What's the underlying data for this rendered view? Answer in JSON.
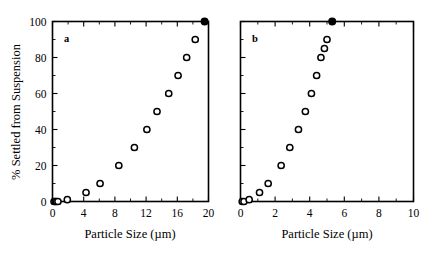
{
  "figure": {
    "background_color": "#ffffff",
    "foreground_color": "#000000",
    "shared_ylabel": "% Settled from Suspension",
    "panel_a_letter": "a",
    "panel_b_letter": "b"
  },
  "chart_data": [
    {
      "type": "scatter",
      "panel": "a",
      "title": "",
      "xlabel": "Particle Size (µm)",
      "ylabel": "% Settled from Suspension",
      "xlim": [
        0,
        20
      ],
      "ylim": [
        0,
        100
      ],
      "xticks": [
        0,
        4,
        8,
        12,
        16,
        20
      ],
      "xticklabels": [
        "0",
        "4",
        "8",
        "12",
        "16",
        "20"
      ],
      "xminor_step": 2,
      "yticks": [
        0,
        20,
        40,
        60,
        80,
        100
      ],
      "yticklabels": [
        "0",
        "20",
        "40",
        "60",
        "80",
        "100"
      ],
      "yminor_step": 10,
      "grid": false,
      "legend": false,
      "series": [
        {
          "name": "open-circles",
          "marker": "open-circle",
          "x": [
            0.2,
            0.35,
            0.5,
            0.7,
            1.9,
            4.3,
            6.1,
            8.5,
            10.5,
            12.1,
            13.4,
            14.9,
            16.1,
            17.2,
            18.3
          ],
          "y": [
            0,
            0,
            0,
            0,
            1,
            5,
            10,
            20,
            30,
            40,
            50,
            60,
            70,
            80,
            90
          ]
        },
        {
          "name": "filled-circle",
          "marker": "filled-circle",
          "x": [
            19.5
          ],
          "y": [
            100
          ]
        }
      ]
    },
    {
      "type": "scatter",
      "panel": "b",
      "title": "",
      "xlabel": "Particle Size (µm)",
      "ylabel": "% Settled from Suspension",
      "xlim": [
        0,
        10
      ],
      "ylim": [
        0,
        100
      ],
      "xticks": [
        0,
        2,
        4,
        6,
        8,
        10
      ],
      "xticklabels": [
        "0",
        "2",
        "4",
        "6",
        "8",
        "10"
      ],
      "xminor_step": 1,
      "yticks": [
        0,
        20,
        40,
        60,
        80,
        100
      ],
      "yticklabels": [
        "0",
        "20",
        "40",
        "60",
        "80",
        "100"
      ],
      "yminor_step": 10,
      "grid": false,
      "legend": false,
      "series": [
        {
          "name": "open-circles",
          "marker": "open-circle",
          "x": [
            0.1,
            0.2,
            0.5,
            1.1,
            1.6,
            2.35,
            2.85,
            3.35,
            3.75,
            4.1,
            4.4,
            4.65,
            4.85,
            5.0
          ],
          "y": [
            0,
            0,
            1,
            5,
            10,
            20,
            30,
            40,
            50,
            60,
            70,
            80,
            85,
            90
          ]
        },
        {
          "name": "filled-circle",
          "marker": "filled-circle",
          "x": [
            5.3
          ],
          "y": [
            100
          ]
        }
      ]
    }
  ]
}
